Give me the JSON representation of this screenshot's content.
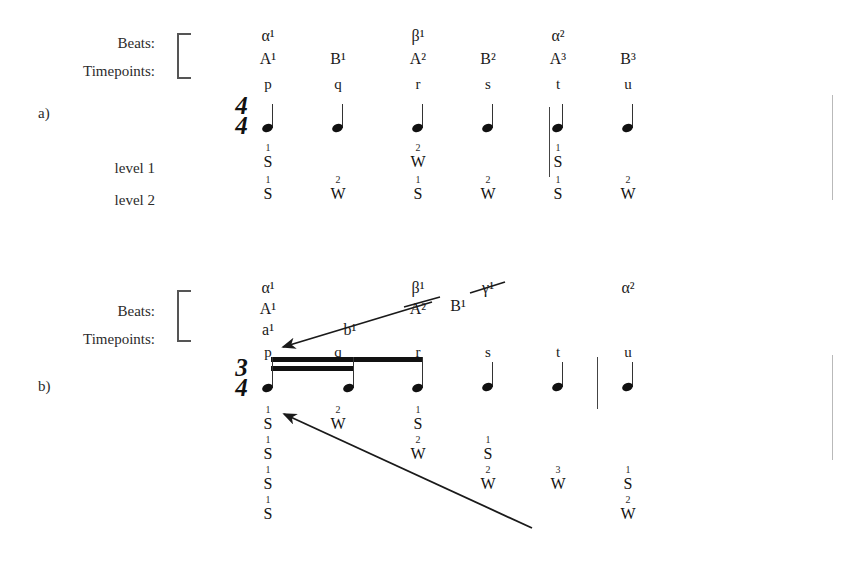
{
  "figure": {
    "panels": [
      {
        "id": "a",
        "panel_label": "a)",
        "row_labels": {
          "beats": "Beats:",
          "timepoints": "Timepoints:"
        },
        "time_signature": {
          "top": "4",
          "bottom": "4"
        },
        "timepoints": [
          "p",
          "q",
          "r",
          "s",
          "t",
          "u"
        ],
        "beat_rows": [
          {
            "name": "greek",
            "cells": [
              "α¹",
              "",
              "β¹",
              "",
              "α²",
              ""
            ]
          },
          {
            "name": "latin",
            "cells": [
              "A¹",
              "B¹",
              "A²",
              "B²",
              "A³",
              "B³"
            ]
          }
        ],
        "levels": [
          {
            "label": "level 1",
            "cells": [
              {
                "num": "1",
                "letter": "S"
              },
              {
                "num": "",
                "letter": ""
              },
              {
                "num": "2",
                "letter": "W"
              },
              {
                "num": "",
                "letter": ""
              },
              {
                "num": "1",
                "letter": "S"
              },
              {
                "num": "",
                "letter": ""
              }
            ]
          },
          {
            "label": "level 2",
            "cells": [
              {
                "num": "1",
                "letter": "S"
              },
              {
                "num": "2",
                "letter": "W"
              },
              {
                "num": "1",
                "letter": "S"
              },
              {
                "num": "2",
                "letter": "W"
              },
              {
                "num": "1",
                "letter": "S"
              },
              {
                "num": "2",
                "letter": "W"
              }
            ]
          }
        ],
        "barlines_before": [
          "t"
        ],
        "beams": []
      },
      {
        "id": "b",
        "panel_label": "b)",
        "row_labels": {
          "beats": "Beats:",
          "timepoints": "Timepoints:"
        },
        "time_signature": {
          "top": "3",
          "bottom": "4"
        },
        "timepoints": [
          "p",
          "q",
          "r",
          "s",
          "t",
          "u"
        ],
        "beat_rows": [
          {
            "name": "greek",
            "cells": [
              "α¹",
              "",
              "β¹",
              "γ¹",
              "",
              "α²"
            ]
          },
          {
            "name": "latin",
            "cells": [
              "A¹",
              "",
              "A²",
              "",
              "",
              ""
            ]
          },
          {
            "name": "lower",
            "cells": [
              "a¹",
              "b¹",
              "",
              "",
              "",
              ""
            ]
          }
        ],
        "floating_beat_labels": [
          {
            "text": "B¹",
            "x": 452,
            "y": 306
          }
        ],
        "levels": [
          {
            "label": "",
            "cells": [
              {
                "num": "1",
                "letter": "S"
              },
              {
                "num": "2",
                "letter": "W"
              },
              {
                "num": "1",
                "letter": "S"
              },
              {
                "num": "",
                "letter": ""
              },
              {
                "num": "",
                "letter": ""
              },
              {
                "num": "",
                "letter": ""
              }
            ]
          },
          {
            "label": "",
            "cells": [
              {
                "num": "1",
                "letter": "S"
              },
              {
                "num": "",
                "letter": ""
              },
              {
                "num": "2",
                "letter": "W"
              },
              {
                "num": "1",
                "letter": "S"
              },
              {
                "num": "",
                "letter": ""
              },
              {
                "num": "",
                "letter": ""
              }
            ]
          },
          {
            "label": "",
            "cells": [
              {
                "num": "1",
                "letter": "S"
              },
              {
                "num": "",
                "letter": ""
              },
              {
                "num": "",
                "letter": ""
              },
              {
                "num": "2",
                "letter": "W"
              },
              {
                "num": "3",
                "letter": "W"
              },
              {
                "num": "1",
                "letter": "S"
              }
            ]
          },
          {
            "label": "",
            "cells": [
              {
                "num": "1",
                "letter": "S"
              },
              {
                "num": "",
                "letter": ""
              },
              {
                "num": "",
                "letter": ""
              },
              {
                "num": "",
                "letter": ""
              },
              {
                "num": "",
                "letter": ""
              },
              {
                "num": "2",
                "letter": "W"
              }
            ]
          }
        ],
        "barlines_before": [
          "u"
        ],
        "beams": [
          {
            "from": "p",
            "to": "r",
            "count": 1
          },
          {
            "from": "p",
            "to": "q",
            "count": 2
          }
        ]
      }
    ],
    "annotations": [
      {
        "name": "b1-to-p-arrow",
        "x1": 432,
        "y1": 302,
        "x2": 280,
        "y2": 348
      },
      {
        "name": "B1-to-beta1-arrow",
        "x1": 500,
        "y1": 284,
        "x2": 440,
        "y2": 300
      },
      {
        "name": "long-diagonal-arrow",
        "x1": 532,
        "y1": 528,
        "x2": 281,
        "y2": 414
      }
    ]
  }
}
